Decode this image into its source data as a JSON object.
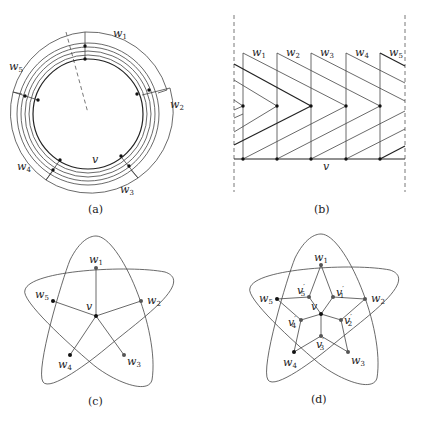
{
  "figure": {
    "panels": [
      {
        "id": "a",
        "caption": "(a)",
        "labels": {
          "v": "v",
          "w": [
            "w",
            "w",
            "w",
            "w",
            "w"
          ],
          "w_sub": [
            "1",
            "2",
            "3",
            "4",
            "5"
          ]
        }
      },
      {
        "id": "b",
        "caption": "(b)",
        "labels": {
          "v": "v",
          "w": [
            "w",
            "w",
            "w",
            "w",
            "w"
          ],
          "w_sub": [
            "1",
            "2",
            "3",
            "4",
            "5"
          ]
        }
      },
      {
        "id": "c",
        "caption": "(c)",
        "labels": {
          "v": "v",
          "w": [
            "w",
            "w",
            "w",
            "w",
            "w"
          ],
          "w_sub": [
            "1",
            "2",
            "3",
            "4",
            "5"
          ]
        }
      },
      {
        "id": "d",
        "caption": "(d)",
        "labels": {
          "v": "v",
          "w": [
            "w",
            "w",
            "w",
            "w",
            "w"
          ],
          "w_sub": [
            "1",
            "2",
            "3",
            "4",
            "5"
          ],
          "vp": [
            "v",
            "v",
            "v",
            "v",
            "v"
          ],
          "vp_sub": [
            "1",
            "2",
            "3",
            "4",
            "5"
          ],
          "prime": "′"
        }
      }
    ]
  }
}
